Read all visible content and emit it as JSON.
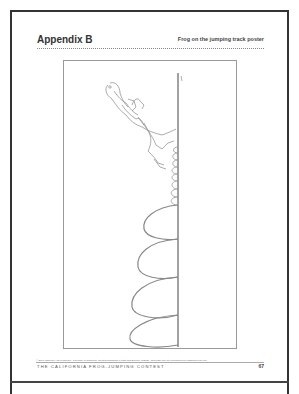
{
  "header": {
    "appendix": "Appendix B",
    "subtitle": "Frog on the jumping track poster"
  },
  "poster": {
    "description": "Frog jumping illustration with vertical track line and arc trajectories",
    "small_loops": 8,
    "large_arcs": 4
  },
  "footer": {
    "copyright": "© 2007 Lawrence Hall of Science, University of California. Great Explorations in Math and Science (GEMS). This page may be reproduced for classroom use only.",
    "title": "THE CALIFORNIA FROG-JUMPING CONTEST",
    "page_number": "67"
  }
}
